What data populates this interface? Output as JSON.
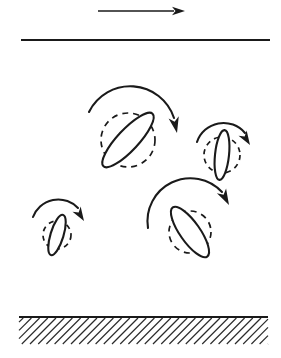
{
  "figure": {
    "width": 281,
    "height": 358,
    "background_color": "#ffffff",
    "ink_color": "#1a1a1a"
  },
  "flow_arrow": {
    "name": "flow-direction-arrow",
    "direction": "right",
    "x1": 98,
    "y1": 11,
    "x2": 185,
    "y2": 11,
    "head_length": 13,
    "head_half_width": 4.2,
    "stroke_width": 1.5
  },
  "top_boundary": {
    "name": "upper-boundary-line",
    "x1": 21,
    "y1": 40,
    "x2": 270,
    "y2": 40,
    "stroke_width": 1.9
  },
  "ground": {
    "name": "ground-surface",
    "line_y": 317,
    "x1": 19,
    "x2": 268,
    "stroke_width": 1.9,
    "hatch": {
      "band_height": 27,
      "spacing": 8.2,
      "angle_deg": 45,
      "stroke_width": 1.15,
      "color": "#2a2a2a"
    }
  },
  "particles": [
    {
      "name": "particle-upper-left",
      "cx": 128,
      "cy": 140,
      "rx": 36,
      "ry": 10.5,
      "rotation_deg": -47,
      "orbit_radius": 27,
      "dash": "6 5",
      "spin_arc": {
        "name": "spin-arrow-upper-left",
        "path": "M 89 112 A 46 46 0 0 1 174 118",
        "head_x": 177,
        "head_y": 133,
        "head_angle_deg": 78,
        "head_length": 16,
        "head_half_width": 5.2
      }
    },
    {
      "name": "particle-right",
      "cx": 222,
      "cy": 155,
      "rx": 25,
      "ry": 7,
      "rotation_deg": -84,
      "orbit_radius": 18,
      "dash": "5 4.5",
      "spin_arc": {
        "name": "spin-arrow-right",
        "path": "M 197 142 A 28 28 0 0 1 245 133",
        "head_x": 250,
        "head_y": 145,
        "head_angle_deg": 58,
        "head_length": 14,
        "head_half_width": 4.8
      }
    },
    {
      "name": "particle-lower-right",
      "cx": 190,
      "cy": 232,
      "rx": 30,
      "ry": 10,
      "rotation_deg": 55,
      "orbit_radius": 21,
      "dash": "6 5",
      "spin_arc": {
        "name": "spin-arrow-lower-right",
        "path": "M 148 228 A 43 43 0 0 1 222 192",
        "head_x": 229,
        "head_y": 205,
        "head_angle_deg": 62,
        "head_length": 16,
        "head_half_width": 5.2
      }
    },
    {
      "name": "particle-lower-left",
      "cx": 57,
      "cy": 235,
      "rx": 21,
      "ry": 6.5,
      "rotation_deg": -73,
      "orbit_radius": 14,
      "dash": "5 4.5",
      "spin_arc": {
        "name": "spin-arrow-lower-left",
        "path": "M 33 217 A 27 27 0 0 1 78 208",
        "head_x": 84,
        "head_y": 221,
        "head_angle_deg": 58,
        "head_length": 14,
        "head_half_width": 4.8
      }
    }
  ]
}
